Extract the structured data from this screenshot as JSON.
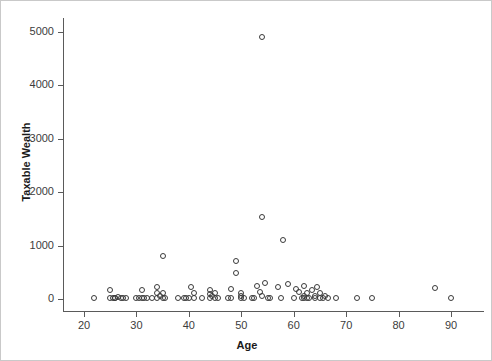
{
  "chart_data": {
    "type": "scatter",
    "title": "",
    "xlabel": "Age",
    "ylabel": "Taxable Wealth",
    "xlim": [
      17,
      93
    ],
    "ylim": [
      -120,
      5200
    ],
    "xticks": [
      20,
      30,
      40,
      50,
      60,
      70,
      80,
      90
    ],
    "yticks": [
      0,
      1000,
      2000,
      3000,
      4000,
      5000
    ],
    "xtick_labels": [
      "20",
      "30",
      "40",
      "50",
      "60",
      "70",
      "80",
      "90"
    ],
    "ytick_labels": [
      "0",
      "1000",
      "2000",
      "3000",
      "4000",
      "5000"
    ],
    "grid": false,
    "legend": false,
    "marker": "open-circle",
    "marker_color": "#3a3a3a",
    "points": [
      {
        "x": 22,
        "y": 10
      },
      {
        "x": 25,
        "y": 15
      },
      {
        "x": 25,
        "y": 170
      },
      {
        "x": 25.5,
        "y": 10
      },
      {
        "x": 26,
        "y": 20
      },
      {
        "x": 26,
        "y": 10
      },
      {
        "x": 26.5,
        "y": 30
      },
      {
        "x": 27,
        "y": 10
      },
      {
        "x": 27.5,
        "y": 15
      },
      {
        "x": 28,
        "y": 10
      },
      {
        "x": 30,
        "y": 10
      },
      {
        "x": 30.5,
        "y": 20
      },
      {
        "x": 31,
        "y": 170
      },
      {
        "x": 31,
        "y": 10
      },
      {
        "x": 31.5,
        "y": 15
      },
      {
        "x": 32,
        "y": 10
      },
      {
        "x": 33,
        "y": 10
      },
      {
        "x": 34,
        "y": 230
      },
      {
        "x": 34,
        "y": 120
      },
      {
        "x": 34,
        "y": 15
      },
      {
        "x": 34.5,
        "y": 60
      },
      {
        "x": 35,
        "y": 810
      },
      {
        "x": 35,
        "y": 120
      },
      {
        "x": 35,
        "y": 10
      },
      {
        "x": 35.5,
        "y": 20
      },
      {
        "x": 38,
        "y": 10
      },
      {
        "x": 39,
        "y": 15
      },
      {
        "x": 39.5,
        "y": 10
      },
      {
        "x": 40,
        "y": 20
      },
      {
        "x": 40.5,
        "y": 230
      },
      {
        "x": 41,
        "y": 120
      },
      {
        "x": 41,
        "y": 10
      },
      {
        "x": 42.5,
        "y": 10
      },
      {
        "x": 44,
        "y": 170
      },
      {
        "x": 44,
        "y": 100
      },
      {
        "x": 44,
        "y": 15
      },
      {
        "x": 44.5,
        "y": 60
      },
      {
        "x": 45,
        "y": 120
      },
      {
        "x": 45,
        "y": 10
      },
      {
        "x": 45.5,
        "y": 20
      },
      {
        "x": 47.5,
        "y": 10
      },
      {
        "x": 48,
        "y": 180
      },
      {
        "x": 48,
        "y": 15
      },
      {
        "x": 49,
        "y": 490
      },
      {
        "x": 49,
        "y": 710
      },
      {
        "x": 50,
        "y": 120
      },
      {
        "x": 50,
        "y": 60
      },
      {
        "x": 50,
        "y": 10
      },
      {
        "x": 50.5,
        "y": 20
      },
      {
        "x": 52,
        "y": 15
      },
      {
        "x": 52.5,
        "y": 10
      },
      {
        "x": 53,
        "y": 250
      },
      {
        "x": 53.5,
        "y": 130
      },
      {
        "x": 54,
        "y": 4910
      },
      {
        "x": 54,
        "y": 1530
      },
      {
        "x": 54,
        "y": 60
      },
      {
        "x": 54.5,
        "y": 300
      },
      {
        "x": 55,
        "y": 10
      },
      {
        "x": 55.5,
        "y": 15
      },
      {
        "x": 57,
        "y": 230
      },
      {
        "x": 57.5,
        "y": 20
      },
      {
        "x": 58,
        "y": 1100
      },
      {
        "x": 59,
        "y": 290
      },
      {
        "x": 60,
        "y": 20
      },
      {
        "x": 60.5,
        "y": 180
      },
      {
        "x": 61,
        "y": 130
      },
      {
        "x": 61.5,
        "y": 15
      },
      {
        "x": 62,
        "y": 250
      },
      {
        "x": 62,
        "y": 60
      },
      {
        "x": 62,
        "y": 10
      },
      {
        "x": 62.5,
        "y": 120
      },
      {
        "x": 62.5,
        "y": 20
      },
      {
        "x": 63,
        "y": 10
      },
      {
        "x": 63.5,
        "y": 170
      },
      {
        "x": 64,
        "y": 60
      },
      {
        "x": 64,
        "y": 10
      },
      {
        "x": 64.5,
        "y": 230
      },
      {
        "x": 65,
        "y": 15
      },
      {
        "x": 65,
        "y": 120
      },
      {
        "x": 65.5,
        "y": 20
      },
      {
        "x": 66,
        "y": 60
      },
      {
        "x": 66.5,
        "y": 10
      },
      {
        "x": 68,
        "y": 15
      },
      {
        "x": 72,
        "y": 20
      },
      {
        "x": 75,
        "y": 10
      },
      {
        "x": 87,
        "y": 200
      },
      {
        "x": 90,
        "y": 10
      }
    ]
  }
}
